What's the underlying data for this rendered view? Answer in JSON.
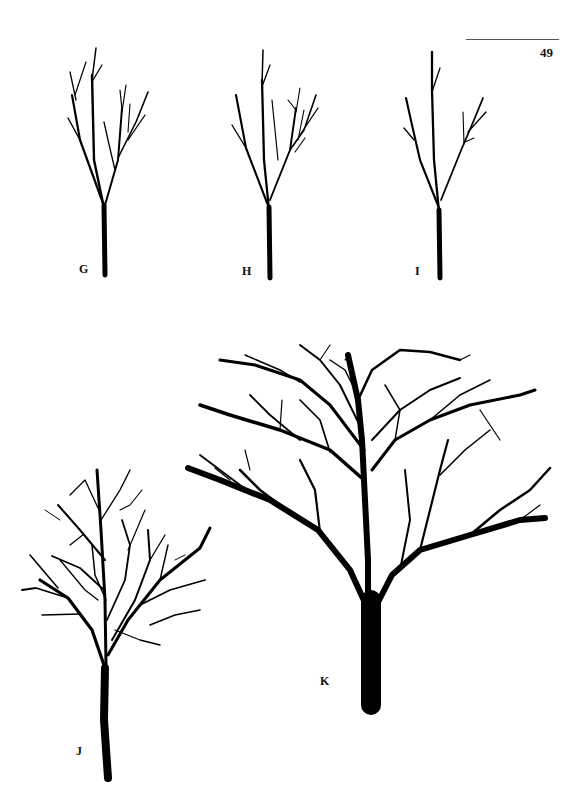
{
  "page": {
    "page_number": "49",
    "figures": [
      {
        "id": "G",
        "label": "G",
        "description": "young sapling, sparse upright branches"
      },
      {
        "id": "H",
        "label": "H",
        "description": "young sapling, sparse upright branches"
      },
      {
        "id": "I",
        "label": "I",
        "description": "young sapling, fewest branches"
      },
      {
        "id": "J",
        "label": "J",
        "description": "small tree with dense rounded crown"
      },
      {
        "id": "K",
        "label": "K",
        "description": "large mature tree with broad spreading crown"
      }
    ]
  },
  "colors": {
    "ink": "#000000",
    "paper": "#ffffff",
    "rule": "#555555"
  }
}
